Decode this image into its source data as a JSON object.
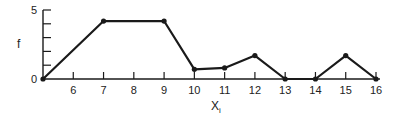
{
  "chart_data": {
    "type": "line",
    "title": "",
    "xlabel": "X",
    "xlabel_subscript": "i",
    "ylabel": "f",
    "x": [
      5,
      7,
      9,
      10,
      11,
      12,
      13,
      14,
      15,
      16
    ],
    "values": [
      0,
      4.2,
      4.2,
      0.7,
      0.8,
      1.7,
      0,
      0,
      1.7,
      0
    ],
    "xlim": [
      5,
      16
    ],
    "ylim": [
      0,
      5
    ],
    "x_tick_labels": [
      "6",
      "7",
      "8",
      "9",
      "10",
      "11",
      "12",
      "13",
      "14",
      "15",
      "16"
    ],
    "y_tick_labels": [
      "0",
      "5"
    ],
    "y_minor_ticks": [
      1,
      2,
      3,
      4
    ],
    "grid": false,
    "legend": null,
    "markers": true,
    "line_color": "#1a1a1a"
  }
}
